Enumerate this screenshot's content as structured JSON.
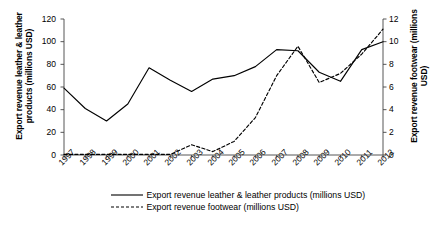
{
  "chart_data": {
    "type": "line",
    "title": "",
    "xlabel": "",
    "grid": false,
    "legend_position": "bottom",
    "categories": [
      "1997",
      "1998",
      "1999",
      "2000",
      "2001",
      "2002",
      "2003",
      "2004",
      "2005",
      "2006",
      "2007",
      "2008",
      "2009",
      "2010",
      "2011",
      "2012"
    ],
    "x_tick_labels": [
      "1997",
      "1998",
      "1999",
      "2000",
      "2001",
      "2002",
      "2003",
      "2004",
      "2005",
      "2006",
      "2007",
      "2008",
      "2009",
      "2010",
      "2011",
      "2012"
    ],
    "axes": {
      "left": {
        "label": "Export revenue leather & leather products (millions USD)",
        "ylim": [
          0,
          120
        ],
        "ticks": [
          0,
          20,
          40,
          60,
          80,
          100,
          120
        ],
        "tick_labels": [
          "0",
          "20",
          "40",
          "60",
          "80",
          "100",
          "120"
        ]
      },
      "right": {
        "label": "Export revenue footwear (millions USD)",
        "ylim": [
          0,
          12
        ],
        "ticks": [
          0,
          2,
          4,
          6,
          8,
          10,
          12
        ],
        "tick_labels": [
          "0",
          "2",
          "4",
          "6",
          "8",
          "10",
          "12"
        ]
      }
    },
    "series": [
      {
        "name": "Export revenue leather & leather products (millions USD)",
        "axis": "left",
        "style": "solid",
        "color": "#000000",
        "values": [
          59,
          41,
          30,
          45,
          77,
          66,
          56,
          67,
          70,
          78,
          93,
          92,
          73,
          65,
          93,
          100
        ]
      },
      {
        "name": "Export revenue footwear (millions USD)",
        "axis": "right",
        "style": "dashed",
        "color": "#000000",
        "values": [
          0.05,
          0.05,
          0.05,
          0.05,
          0.05,
          0.05,
          0.9,
          0.3,
          1.2,
          3.3,
          7.0,
          9.6,
          6.4,
          7.2,
          8.9,
          11.1
        ]
      }
    ]
  },
  "legend": {
    "items": [
      {
        "label": "Export revenue leather & leather products (millions USD)",
        "style": "solid"
      },
      {
        "label": "Export revenue footwear (millions USD)",
        "style": "dashed"
      }
    ]
  }
}
